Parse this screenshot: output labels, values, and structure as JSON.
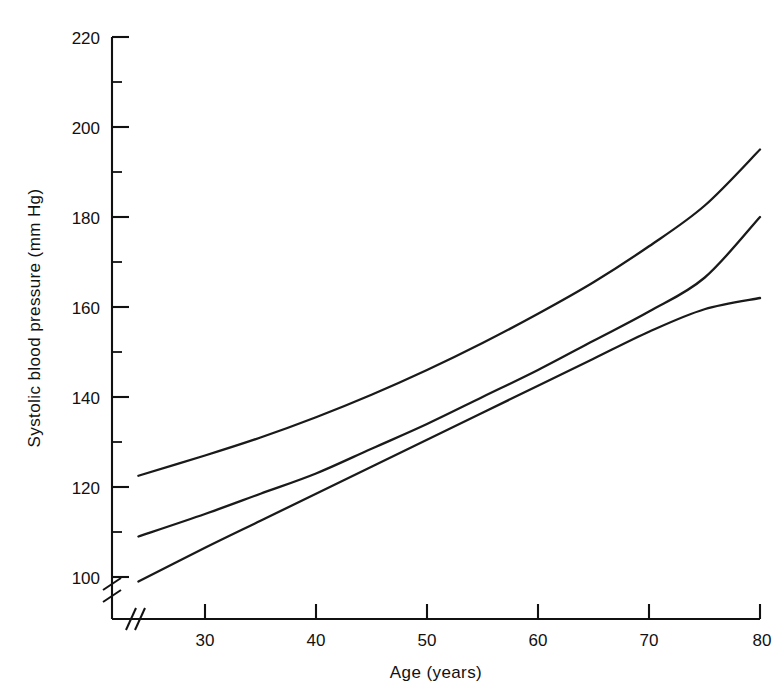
{
  "chart_data": {
    "type": "line",
    "title": "",
    "xlabel": "Age (years)",
    "ylabel": "Systolic blood pressure (mm Hg)",
    "xlim": [
      22,
      80
    ],
    "ylim": [
      92,
      222
    ],
    "axis_break_x": true,
    "axis_break_y": true,
    "grid": false,
    "legend": "none",
    "x_ticks": [
      30,
      40,
      50,
      60,
      70,
      80
    ],
    "x_tick_labels": [
      "30",
      "40",
      "50",
      "60",
      "70",
      "80"
    ],
    "y_ticks": [
      100,
      120,
      140,
      160,
      180,
      200,
      220
    ],
    "y_tick_labels": [
      "100",
      "120",
      "140",
      "160",
      "180",
      "200",
      "220"
    ],
    "y_minor_ticks": [
      110,
      130,
      150,
      170,
      190,
      210
    ],
    "x": [
      24,
      30,
      35,
      40,
      45,
      50,
      55,
      60,
      65,
      70,
      75,
      80
    ],
    "series": [
      {
        "name": "upper band",
        "values": [
          122.5,
          127.0,
          131.0,
          135.5,
          140.5,
          146.0,
          152.0,
          158.5,
          165.5,
          173.5,
          182.5,
          195.0
        ]
      },
      {
        "name": "middle curve",
        "values": [
          109.0,
          114.0,
          118.5,
          123.0,
          128.5,
          134.0,
          140.0,
          146.0,
          152.5,
          159.0,
          166.5,
          180.0
        ]
      },
      {
        "name": "lower band",
        "values": [
          99.0,
          106.5,
          112.5,
          118.5,
          124.5,
          130.5,
          136.5,
          142.5,
          148.5,
          154.5,
          159.5,
          162.0
        ]
      }
    ]
  },
  "figure": {
    "caption_fragment": ""
  }
}
